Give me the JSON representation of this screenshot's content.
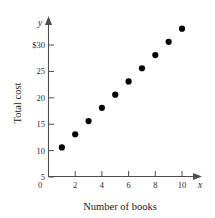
{
  "chart_data": {
    "type": "scatter",
    "title": "",
    "xlabel": "Number of books",
    "ylabel": "Total cost",
    "x_axis_variable": "x",
    "y_axis_variable": "y",
    "grid": false,
    "legend": "none",
    "xlim": [
      0,
      11.4
    ],
    "ylim": [
      0,
      31.5
    ],
    "x_ticks": [
      2,
      4,
      6,
      8,
      10
    ],
    "x_tick_labels": [
      "2",
      "4",
      "6",
      "8",
      "10"
    ],
    "y_ticks": [
      5,
      10,
      15,
      20,
      25,
      30
    ],
    "y_tick_labels": [
      "5",
      "10",
      "15",
      "20",
      "25",
      "$30"
    ],
    "origin_label": "0",
    "x": [
      1,
      2,
      3,
      4,
      5,
      6,
      7,
      8,
      9,
      10
    ],
    "values": [
      5.5,
      8,
      10.5,
      13,
      15.5,
      18,
      20.5,
      23,
      25.5,
      28
    ],
    "point_color": "#000000",
    "axis_color": "#4d4d4d"
  }
}
